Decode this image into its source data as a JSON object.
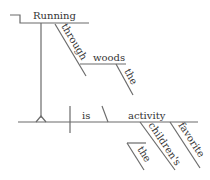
{
  "diagram": {
    "type": "sentence-diagram",
    "sentence": "Running through the woods is the children's favorite activity",
    "colors": {
      "line": "#6b6b6b",
      "text": "#333333",
      "background": "#ffffff"
    },
    "subject_pedestal": {
      "verbal": "Running",
      "preposition": "through",
      "object": "woods",
      "object_modifier": "the"
    },
    "predicate": {
      "verb": "is",
      "complement": "activity",
      "modifiers": [
        "children's",
        "favorite"
      ],
      "possessive_modifier": "the"
    }
  }
}
